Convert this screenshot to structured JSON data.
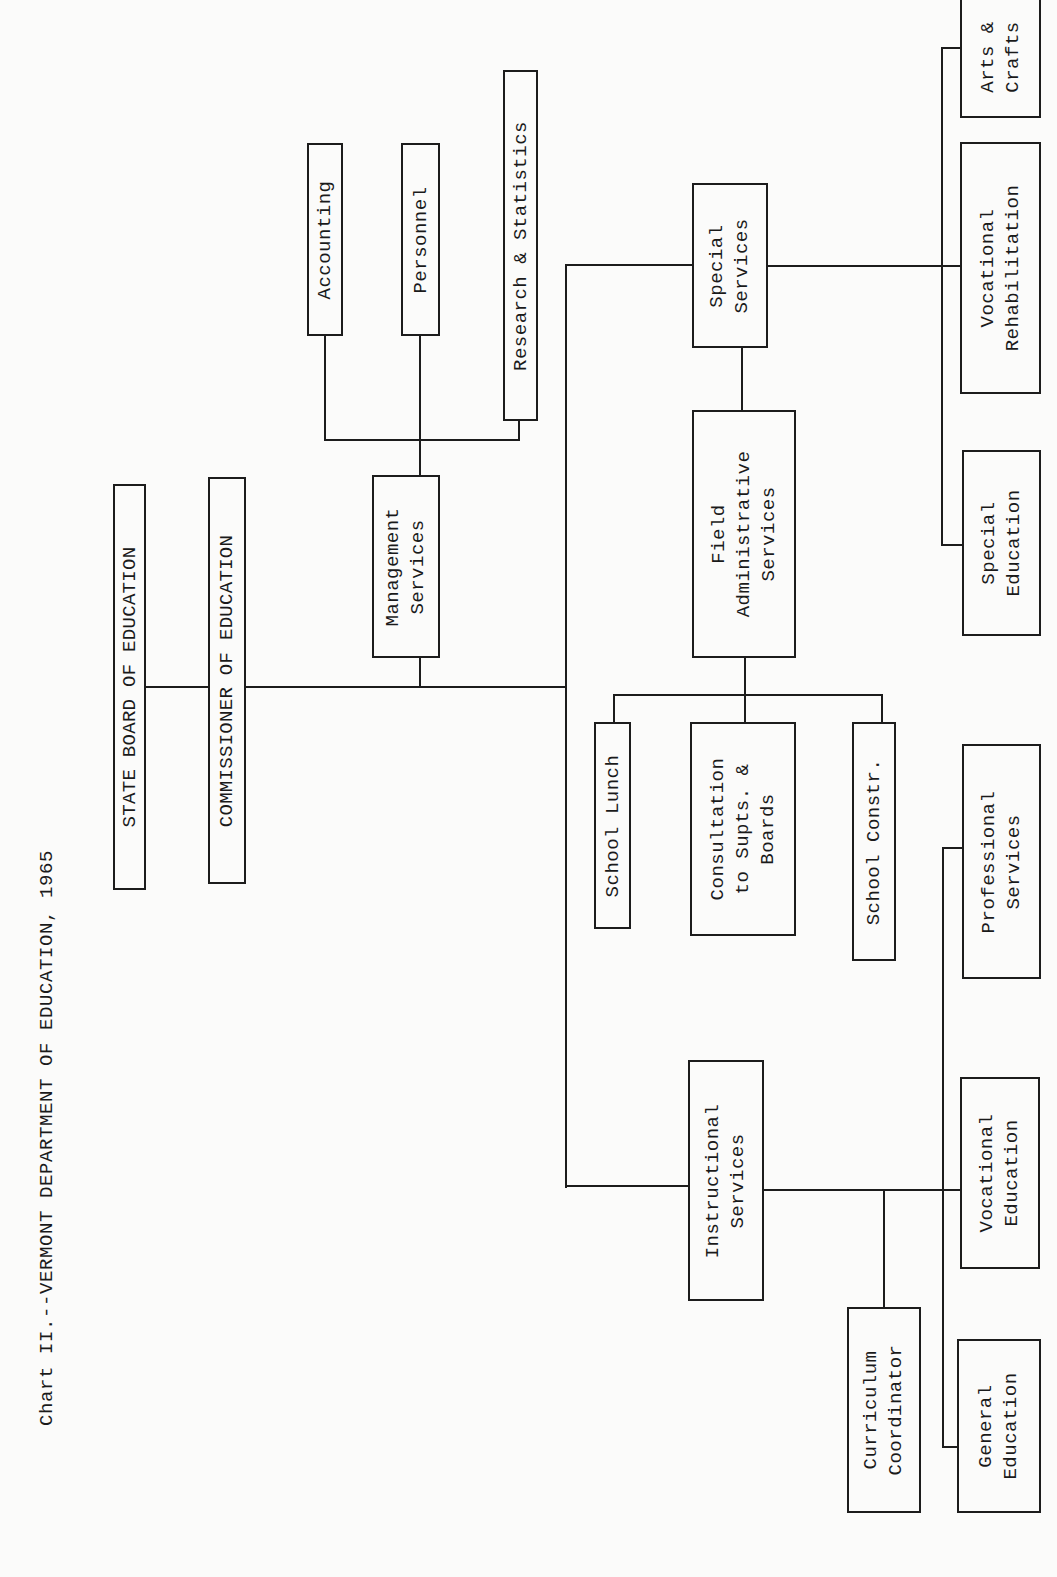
{
  "chart_title": "Chart II.--VERMONT DEPARTMENT OF EDUCATION, 1965",
  "orientation": "rotated -90deg (landscape chart printed on portrait page)",
  "nodes": {
    "state_board": "STATE BOARD OF EDUCATION",
    "commissioner": "COMMISSIONER OF EDUCATION",
    "management": "Management\nServices",
    "accounting": "Accounting",
    "personnel": "Personnel",
    "research": "Research & Statistics",
    "special_services": "Special\nServices",
    "field_admin": "Field\nAdministrative\nServices",
    "school_lunch": "School Lunch",
    "consultation": "Consultation\nto Supts. &\nBoards",
    "school_constr": "School Constr.",
    "instructional": "Instructional\nServices",
    "curriculum": "Curriculum\nCoordinator",
    "general_ed": "General\nEducation",
    "vocational_ed": "Vocational\nEducation",
    "professional": "Professional\nServices",
    "special_ed": "Special\nEducation",
    "voc_rehab": "Vocational\nRehabilitation",
    "arts_crafts": "Arts &\nCrafts"
  },
  "hierarchy": {
    "STATE BOARD OF EDUCATION": [
      "COMMISSIONER OF EDUCATION"
    ],
    "COMMISSIONER OF EDUCATION": [
      "Management Services",
      "Special Services",
      "Field Administrative Services",
      "Instructional Services"
    ],
    "Management Services": [
      "Accounting",
      "Personnel",
      "Research & Statistics"
    ],
    "Special Services": [
      "Special Education",
      "Vocational Rehabilitation",
      "Arts & Crafts"
    ],
    "Field Administrative Services": [
      "School Lunch",
      "Consultation to Supts. & Boards",
      "School Constr."
    ],
    "Instructional Services": [
      "Curriculum Coordinator",
      "General Education",
      "Vocational Education",
      "Professional Services"
    ]
  }
}
